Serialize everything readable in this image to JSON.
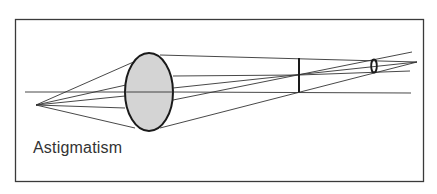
{
  "figure": {
    "caption": "Astigmatism",
    "colors": {
      "frame": "#3a3a3a",
      "lines": "#333333",
      "lens_fill": "#d4d4d4",
      "lens_stroke": "#1a1a1a",
      "background": "#ffffff"
    },
    "elements": {
      "frame": {
        "x": 15,
        "y": 19,
        "width": 409,
        "height": 163
      },
      "point_source": {
        "x": 36,
        "y": 105
      },
      "optical_axis_y": 92,
      "lens": {
        "cx": 149,
        "cy": 92,
        "rx": 24,
        "ry": 39
      },
      "tangential_focal_line": {
        "x": 299,
        "y1": 59,
        "y2": 92
      },
      "sagittal_focal_ellipse": {
        "cx": 374,
        "cy": 66,
        "rx": 3,
        "ry": 7
      }
    }
  }
}
